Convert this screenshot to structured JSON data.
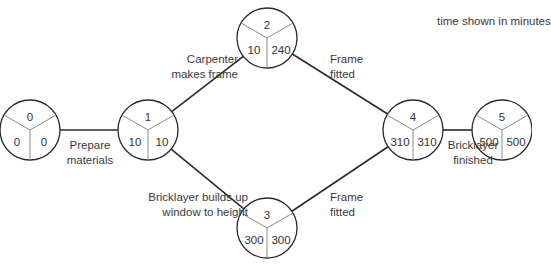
{
  "note": "time shown in minutes",
  "colors": {
    "line": "#2a2a2a",
    "divider": "#8a8a8a",
    "text": "#333333",
    "background": "#ffffff"
  },
  "nodes": [
    {
      "id": "0",
      "earliest": "0",
      "latest": "0",
      "cx": 30,
      "cy": 130
    },
    {
      "id": "1",
      "earliest": "10",
      "latest": "10",
      "cx": 148,
      "cy": 130
    },
    {
      "id": "2",
      "earliest": "10",
      "latest": "240",
      "cx": 267,
      "cy": 38
    },
    {
      "id": "3",
      "earliest": "300",
      "latest": "300",
      "cx": 267,
      "cy": 228
    },
    {
      "id": "4",
      "earliest": "310",
      "latest": "310",
      "cx": 413,
      "cy": 130
    },
    {
      "id": "5",
      "earliest": "500",
      "latest": "500",
      "cx": 502,
      "cy": 130
    }
  ],
  "activities": [
    {
      "from": "0",
      "to": "1",
      "line1": "Prepare",
      "line2": "materials"
    },
    {
      "from": "1",
      "to": "2",
      "line1": "Carpenter",
      "line2": "makes frame"
    },
    {
      "from": "1",
      "to": "3",
      "line1": "Bricklayer builds up",
      "line2": "window to height"
    },
    {
      "from": "2",
      "to": "4",
      "line1": "Frame",
      "line2": "fitted"
    },
    {
      "from": "3",
      "to": "4",
      "line1": "Frame",
      "line2": "fitted"
    },
    {
      "from": "4",
      "to": "5",
      "line1": "Bricklayer",
      "line2": "finished"
    }
  ]
}
